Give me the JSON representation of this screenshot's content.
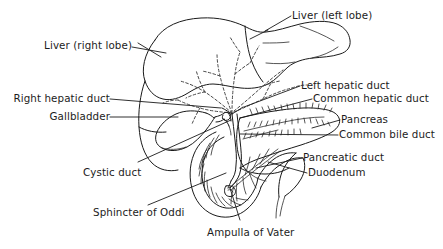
{
  "figure": {
    "background_color": "#ffffff",
    "line_color": "#1a1a1a",
    "text_color": "#1c1c1c",
    "width": 443,
    "height": 249
  },
  "labels": {
    "liver_left_lobe": "Liver (left lobe)",
    "liver_right_lobe": "Liver (right lobe)",
    "left_hepatic_duct": "Left hepatic duct",
    "common_hepatic_duct": "Common hepatic duct",
    "right_hepatic_duct": "Right hepatic duct",
    "gallbladder": "Gallbladder",
    "pancreas": "Pancreas",
    "common_bile_duct": "Common bile duct",
    "pancreatic_duct": "Pancreatic duct",
    "duodenum": "Duodenum",
    "cystic_duct": "Cystic duct",
    "sphincter_of_oddi": "Sphincter of Oddi",
    "ampulla_of_vater": "Ampulla of Vater"
  },
  "structures": [
    {
      "name": "liver",
      "kind": "outline"
    },
    {
      "name": "gallbladder",
      "kind": "outline"
    },
    {
      "name": "duodenum",
      "kind": "outline"
    },
    {
      "name": "pancreas",
      "kind": "outline"
    },
    {
      "name": "intrahepatic-bile-ducts",
      "kind": "dashed"
    },
    {
      "name": "common-bile-duct",
      "kind": "outline"
    },
    {
      "name": "pancreatic-duct",
      "kind": "outline"
    },
    {
      "name": "cystic-duct",
      "kind": "outline"
    }
  ]
}
